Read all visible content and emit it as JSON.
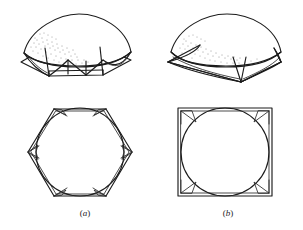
{
  "figure": {
    "background_color": "#ffffff",
    "ink_color": "#1c1c1c",
    "stipple_color": "#3a3a3a",
    "width": 303,
    "height": 230
  },
  "captions": {
    "left": "(a)",
    "left_open_paren": "(",
    "left_letter": "a",
    "left_close_paren": ")",
    "right": "(b)",
    "right_open_paren": "(",
    "right_letter": "b",
    "right_close_paren": ")"
  },
  "panels": [
    {
      "id": "a",
      "caption": "(a)",
      "base_polygon": "hexagon",
      "base_sides": 6,
      "perspective_label": "hexagonal-base pendentive dome, perspective view",
      "plan_label": "hexagonal plan with inscribed circle",
      "pendentive_count": 6,
      "shading": "stipple on upper-left of dome"
    },
    {
      "id": "b",
      "caption": "(b)",
      "base_polygon": "square",
      "base_sides": 4,
      "perspective_label": "square-base pendentive dome, perspective view",
      "plan_label": "square plan with inscribed circle",
      "pendentive_count": 4,
      "shading": "stipple on upper-left of dome"
    }
  ]
}
